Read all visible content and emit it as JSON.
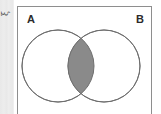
{
  "figure": {
    "type": "venn-diagram",
    "universal_set_label": "ξ",
    "set_a_label": "A",
    "set_b_label": "B",
    "shaded_region": "A ∩ B",
    "colors": {
      "shade_fill": "#8a8a8a",
      "circle_stroke": "#6f6f6f",
      "circle_fill": "#ffffff",
      "rect_stroke": "#8e8e8e",
      "rect_fill": "#ffffff",
      "margin_band": "#e9e9e9",
      "label_text": "#2b2b2b"
    },
    "geometry": {
      "circle_a": {
        "cx": 41,
        "cy": 60,
        "r": 36
      },
      "circle_b": {
        "cx": 87,
        "cy": 60,
        "r": 36
      },
      "rect": {
        "x": 17,
        "y": 6,
        "width": 135,
        "height": 112
      }
    }
  }
}
